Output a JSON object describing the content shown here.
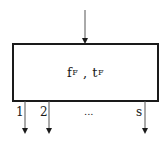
{
  "diagram": {
    "block": {
      "main": [
        "f",
        "t"
      ],
      "subscript": "F",
      "separator": " , "
    },
    "input_arrow": {
      "direction": "down"
    },
    "outputs": [
      {
        "label": "1"
      },
      {
        "label": "2"
      },
      {
        "label": "s"
      }
    ],
    "ellipsis": "..."
  }
}
